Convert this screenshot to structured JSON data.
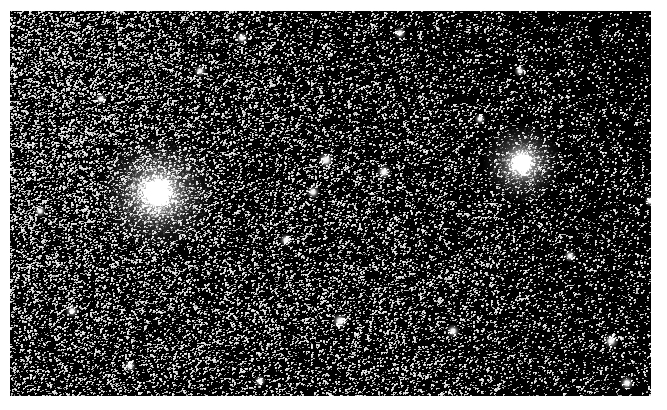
{
  "image": {
    "kind": "astronomical-photograph",
    "subject": "dense galactic star field with two globular clusters",
    "medium": "halftone / dithered monochrome print",
    "canvas_width": 667,
    "canvas_height": 410,
    "paper_color": "#ffffff",
    "sky_color": "#000000",
    "star_color": "#ffffff"
  },
  "plate": {
    "x": 10,
    "y": 11,
    "width": 641,
    "height": 385
  },
  "chart_data": {
    "type": "scatter",
    "title": "",
    "xlabel": "",
    "ylabel": "",
    "xlim": [
      0,
      641
    ],
    "ylim": [
      0,
      385
    ],
    "grid": false,
    "legend_position": "none",
    "background": "#000000",
    "point_color": "#ffffff",
    "field_star_count": 46000,
    "density_gradient": {
      "note": "Star surface density is highest at the left and lower-left, decreasing toward the upper-right corner.",
      "max_density_corner": "lower-left",
      "min_density_corner": "upper-right",
      "left_density": 1.0,
      "right_density": 0.42,
      "top_density": 0.8,
      "bottom_density": 0.95
    },
    "clusters": [
      {
        "name": "cluster-primary",
        "label": "bright globular cluster",
        "cx": 147,
        "cy": 182,
        "core_radius": 14,
        "halo_radius": 58,
        "peak_brightness": 255,
        "member_count": 2600
      },
      {
        "name": "cluster-secondary",
        "label": "smaller globular cluster",
        "cx": 512,
        "cy": 152,
        "core_radius": 10,
        "halo_radius": 40,
        "peak_brightness": 255,
        "member_count": 1200
      }
    ],
    "bright_field_stars": [
      {
        "x": 316,
        "y": 149,
        "r": 2.4
      },
      {
        "x": 303,
        "y": 181,
        "r": 2.0
      },
      {
        "x": 374,
        "y": 161,
        "r": 2.2
      },
      {
        "x": 276,
        "y": 229,
        "r": 1.9
      },
      {
        "x": 330,
        "y": 310,
        "r": 2.3
      },
      {
        "x": 443,
        "y": 320,
        "r": 2.0
      },
      {
        "x": 601,
        "y": 330,
        "r": 2.2
      },
      {
        "x": 617,
        "y": 372,
        "r": 2.1
      },
      {
        "x": 91,
        "y": 88,
        "r": 1.8
      },
      {
        "x": 190,
        "y": 60,
        "r": 1.8
      },
      {
        "x": 232,
        "y": 27,
        "r": 1.9
      },
      {
        "x": 390,
        "y": 22,
        "r": 1.8
      },
      {
        "x": 510,
        "y": 60,
        "r": 1.7
      },
      {
        "x": 560,
        "y": 245,
        "r": 1.8
      },
      {
        "x": 62,
        "y": 300,
        "r": 1.9
      },
      {
        "x": 120,
        "y": 355,
        "r": 1.8
      },
      {
        "x": 250,
        "y": 370,
        "r": 1.7
      },
      {
        "x": 470,
        "y": 108,
        "r": 1.7
      },
      {
        "x": 640,
        "y": 190,
        "r": 1.7
      },
      {
        "x": 30,
        "y": 200,
        "r": 1.8
      }
    ]
  },
  "annotations": {
    "caption": "",
    "scale_bar": "",
    "north_arrow": ""
  }
}
